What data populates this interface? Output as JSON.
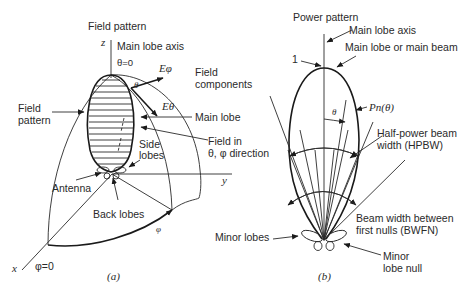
{
  "panel_a": {
    "caption": "(a)",
    "title": "Field pattern",
    "axes": {
      "z": "z",
      "x": "x",
      "y": "y"
    },
    "labels": {
      "main_lobe_axis": "Main lobe axis",
      "theta_zero": "θ=0",
      "e_phi": "Eφ",
      "e_theta": "Eθ",
      "theta": "θ",
      "field_components_1": "Field",
      "field_components_2": "components",
      "field_pattern_1": "Field",
      "field_pattern_2": "pattern",
      "main_lobe": "Main lobe",
      "field_in_1": "Field in",
      "field_in_2": "θ, φ direction",
      "side_lobes_1": "Side",
      "side_lobes_2": "lobes",
      "antenna": "Antenna",
      "back_lobes": "Back lobes",
      "phi": "φ",
      "phi_zero": "φ=0"
    }
  },
  "panel_b": {
    "caption": "(b)",
    "title": "Power pattern",
    "labels": {
      "main_lobe_axis": "Main lobe axis",
      "main_lobe_or_beam": "Main lobe or main beam",
      "one": "1",
      "theta": "θ",
      "pn_theta": "Pn(θ)",
      "hpbw_1": "Half-power beam",
      "hpbw_2": "width (HPBW)",
      "bwfn_1": "Beam width between",
      "bwfn_2": "first nulls (BWFN)",
      "minor_lobes": "Minor lobes",
      "minor_lobe_null_1": "Minor",
      "minor_lobe_null_2": "lobe null"
    }
  }
}
